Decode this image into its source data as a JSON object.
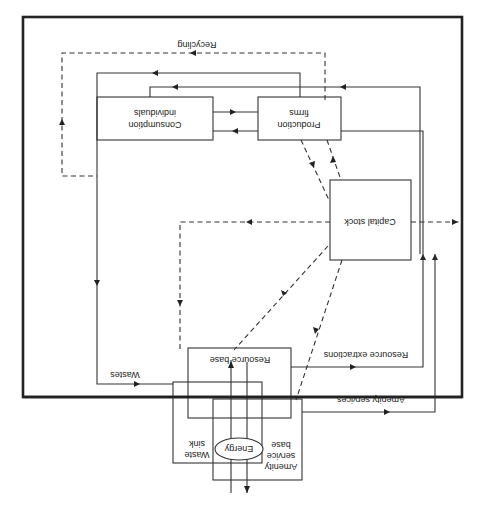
{
  "diagram": {
    "orientation": "rotated 180 degrees",
    "caption_fragment": "",
    "nodes": {
      "consumption": {
        "line1": "Consumption",
        "line2": "individuals"
      },
      "production": {
        "line1": "Production",
        "line2": "firms"
      },
      "capital": {
        "label": "Capital stock"
      },
      "resource_base": {
        "label": "Resource base"
      },
      "waste_sink": {
        "line1": "Waste",
        "line2": "sink"
      },
      "amenity_base": {
        "line1": "Amenity",
        "line2": "service",
        "line3": "base"
      },
      "energy": {
        "label": "Energy"
      }
    },
    "flows": {
      "recycling": "Recycling",
      "wastes": "Wastes",
      "resource_extractions": "Resource extractions",
      "amenity_services": "Amenity services"
    },
    "colors": {
      "line": "#333333",
      "border": "#222222",
      "background": "#ffffff"
    }
  }
}
